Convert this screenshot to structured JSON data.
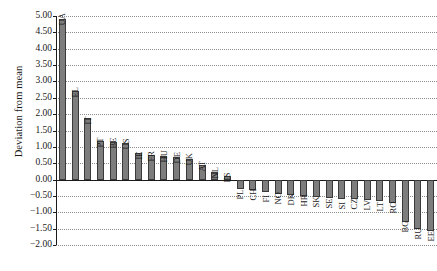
{
  "chart_data": {
    "type": "bar",
    "title": "",
    "xlabel": "",
    "ylabel": "Deviation from mean",
    "ylim": [
      -2.0,
      5.0
    ],
    "ytick_step": 0.5,
    "ytick_labels": [
      "5.00",
      "4.50",
      "4.00",
      "3.50",
      "3.00",
      "2.50",
      "2.00",
      "1.50",
      "1.00",
      "0.50",
      "0.00",
      "−0.50",
      "−1.00",
      "−1.50",
      "−2.00"
    ],
    "grid": true,
    "grid_style": "dotted-horizontal",
    "legend": "none",
    "bar_color": "#7d7d7d",
    "bar_edge_color": "#3a3a3a",
    "categories": [
      "UA",
      "EL",
      "IT",
      "PT",
      "BE",
      "US",
      "IE",
      "FR",
      "HU",
      "DE",
      "UK",
      "AT",
      "NL",
      "ES",
      "PL",
      "CH",
      "FI",
      "NO",
      "DK",
      "HR",
      "SK",
      "SE",
      "SI",
      "CZ",
      "LV",
      "LT",
      "RO",
      "BG",
      "RU",
      "EE"
    ],
    "values": [
      4.9,
      2.72,
      1.88,
      1.17,
      1.15,
      1.12,
      0.82,
      0.74,
      0.72,
      0.68,
      0.62,
      0.46,
      0.22,
      0.12,
      -0.28,
      -0.32,
      -0.38,
      -0.44,
      -0.46,
      -0.5,
      -0.54,
      -0.56,
      -0.58,
      -0.6,
      -0.62,
      -0.66,
      -0.72,
      -1.3,
      -1.52,
      -1.58
    ]
  }
}
